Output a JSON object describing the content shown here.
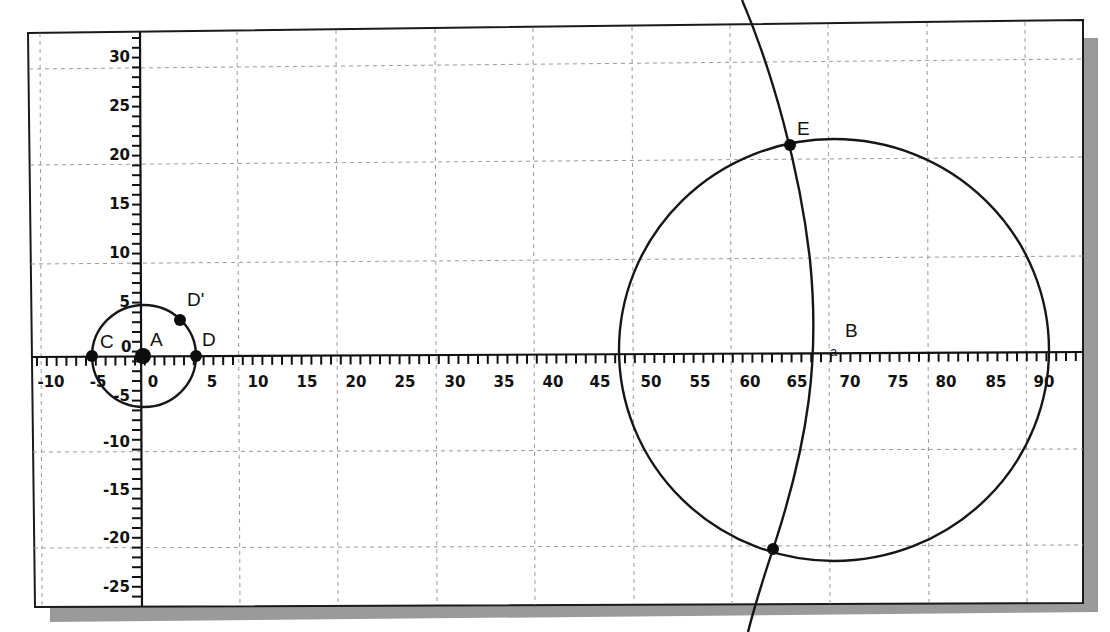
{
  "chart_data": {
    "type": "geometry-construction",
    "title": "",
    "x_axis": {
      "tick_labels": [
        "-10",
        "-5",
        "0",
        "5",
        "10",
        "15",
        "20",
        "25",
        "30",
        "35",
        "40",
        "45",
        "50",
        "55",
        "60",
        "65",
        "70",
        "75",
        "80",
        "85",
        "90"
      ],
      "range": [
        -12,
        95
      ]
    },
    "y_axis": {
      "tick_labels": [
        "30",
        "25",
        "20",
        "15",
        "10",
        "5",
        "0",
        "-5",
        "-10",
        "-15",
        "-20",
        "-25"
      ],
      "range": [
        -27,
        32
      ]
    },
    "grid": true,
    "points": [
      {
        "label": "A",
        "x": 0,
        "y": 0
      },
      {
        "label": "C",
        "x": -5.2,
        "y": 0
      },
      {
        "label": "D",
        "x": 5.3,
        "y": 0
      },
      {
        "label": "D'",
        "x": 3.7,
        "y": 3.7
      },
      {
        "label": "B",
        "x": 70,
        "y": 0.6
      },
      {
        "label": "E",
        "x": 66,
        "y": 21.7
      },
      {
        "label": "",
        "x": 64,
        "y": -19.8
      }
    ],
    "circles": [
      {
        "name": "small circle",
        "center": [
          0,
          0
        ],
        "radius": 5.3
      },
      {
        "name": "large circle",
        "center": [
          70,
          0.6
        ],
        "radius": 21.7
      }
    ],
    "arcs": [
      {
        "name": "intersecting arc",
        "passes_through": [
          "E",
          "unlabeled intersection point"
        ]
      }
    ]
  },
  "labels": {
    "A": "A",
    "B": "B",
    "C": "C",
    "D": "D",
    "Dprime": "D'",
    "E": "E",
    "B_marker": "a",
    "origin_zero_y": "0"
  },
  "x_ticks": [
    {
      "label": "-10",
      "x": 51
    },
    {
      "label": "-5",
      "x": 98
    },
    {
      "label": "0",
      "x": 153
    },
    {
      "label": "5",
      "x": 212
    },
    {
      "label": "10",
      "x": 258
    },
    {
      "label": "15",
      "x": 307
    },
    {
      "label": "20",
      "x": 356
    },
    {
      "label": "25",
      "x": 405
    },
    {
      "label": "30",
      "x": 455
    },
    {
      "label": "35",
      "x": 504
    },
    {
      "label": "40",
      "x": 553
    },
    {
      "label": "45",
      "x": 600
    },
    {
      "label": "50",
      "x": 651
    },
    {
      "label": "55",
      "x": 700
    },
    {
      "label": "60",
      "x": 750
    },
    {
      "label": "65",
      "x": 797
    },
    {
      "label": "70",
      "x": 850
    },
    {
      "label": "75",
      "x": 898
    },
    {
      "label": "80",
      "x": 946
    },
    {
      "label": "85",
      "x": 996
    },
    {
      "label": "90",
      "x": 1044
    }
  ],
  "y_ticks": [
    {
      "label": "30",
      "y": 62
    },
    {
      "label": "25",
      "y": 111
    },
    {
      "label": "20",
      "y": 160
    },
    {
      "label": "15",
      "y": 209
    },
    {
      "label": "10",
      "y": 258
    },
    {
      "label": "5",
      "y": 307
    },
    {
      "label": "-5",
      "y": 401
    },
    {
      "label": "-10",
      "y": 447
    },
    {
      "label": "-15",
      "y": 495
    },
    {
      "label": "-20",
      "y": 543
    },
    {
      "label": "-25",
      "y": 592
    }
  ]
}
